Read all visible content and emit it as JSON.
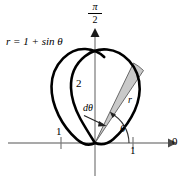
{
  "figure": {
    "equation_label": {
      "lhs": "r",
      "equals": " = 1 + sin ",
      "variable": "θ",
      "full": "r = 1 + sin θ"
    },
    "axes": {
      "vertical_top_label": {
        "numerator": "π",
        "denominator": "2",
        "full": "π/2"
      },
      "horizontal_right_label": "0",
      "tick_labels": {
        "y_two": "2",
        "x_left_one": "1",
        "x_right_one": "1"
      }
    },
    "annotations": {
      "d_theta": "dθ",
      "theta": "θ",
      "radius": "r"
    },
    "colors": {
      "curve": "#000000",
      "axis": "#808080",
      "wedge_fill": "#c9c9c9",
      "wedge_stroke": "#4d4d4d",
      "background": "#ffffff",
      "text": "#000000"
    },
    "geometry": {
      "origin_x": 95,
      "origin_y": 143,
      "unit_px": 46,
      "theta_deg": 62,
      "d_theta_deg": 7
    }
  }
}
